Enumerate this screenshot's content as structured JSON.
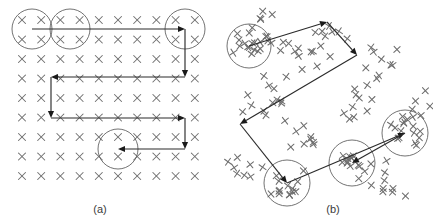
{
  "figure": {
    "width": 433,
    "height": 224,
    "background_color": "#ffffff",
    "mark_color": "#6e6e6e",
    "circle_color": "#5a5a5a",
    "arrow_color": "#1a1a1a",
    "caption_color": "#3a3a3a"
  },
  "panels": [
    {
      "id": "panel-a",
      "caption": "(a)",
      "caption_x": 100,
      "caption_y": 213,
      "description": "Regular rectangular lattice of x-marks traversed by a boustrophedon (serpentine) raster path; three circular regions highlight clusters.",
      "grid": {
        "type": "regular-lattice",
        "columns": 10,
        "rows": 9,
        "x_start": 22,
        "y_start": 20,
        "x_step": 19.2,
        "y_step": 19.5,
        "mark_size": 7
      },
      "circles": [
        {
          "name": "cluster-circle-a1",
          "cx": 32,
          "cy": 29,
          "r": 20
        },
        {
          "name": "cluster-circle-a2",
          "cx": 70,
          "cy": 29,
          "r": 20
        },
        {
          "name": "cluster-circle-a3",
          "cx": 185,
          "cy": 29,
          "r": 20
        },
        {
          "name": "cluster-circle-a4",
          "cx": 118,
          "cy": 149,
          "r": 20
        }
      ],
      "path": {
        "type": "serpentine-raster",
        "segments": [
          {
            "name": "segment-a-1",
            "x1": 32,
            "y1": 29,
            "x2": 185,
            "y2": 29,
            "arrow": "end"
          },
          {
            "name": "segment-a-2",
            "x1": 185,
            "y1": 29,
            "x2": 185,
            "y2": 77,
            "arrow": "end"
          },
          {
            "name": "segment-a-3",
            "x1": 185,
            "y1": 77,
            "x2": 51,
            "y2": 77,
            "arrow": "end"
          },
          {
            "name": "segment-a-4",
            "x1": 51,
            "y1": 77,
            "x2": 51,
            "y2": 118,
            "arrow": "end"
          },
          {
            "name": "segment-a-5",
            "x1": 51,
            "y1": 118,
            "x2": 185,
            "y2": 118,
            "arrow": "end"
          },
          {
            "name": "segment-a-6",
            "x1": 185,
            "y1": 118,
            "x2": 185,
            "y2": 149,
            "arrow": "end"
          },
          {
            "name": "segment-a-7",
            "x1": 185,
            "y1": 149,
            "x2": 118,
            "y2": 149,
            "arrow": "end"
          }
        ]
      }
    },
    {
      "id": "panel-b",
      "caption": "(b)",
      "caption_x": 333,
      "caption_y": 213,
      "description": "Irregular scatter of x-marks traversed by a zig-zag tour between four circled clusters.",
      "scatter": {
        "type": "irregular-scatter",
        "mark_size": 6,
        "count": 148
      },
      "circles": [
        {
          "name": "cluster-circle-b1",
          "cx": 249,
          "cy": 46,
          "r": 22
        },
        {
          "name": "cluster-circle-b2",
          "cx": 405,
          "cy": 133,
          "r": 23
        },
        {
          "name": "cluster-circle-b3",
          "cx": 352,
          "cy": 163,
          "r": 23
        },
        {
          "name": "cluster-circle-b4",
          "cx": 287,
          "cy": 183,
          "r": 23
        }
      ],
      "path": {
        "type": "zig-zag-tour",
        "segments": [
          {
            "name": "segment-b-1",
            "x1": 249,
            "y1": 46,
            "x2": 327,
            "y2": 22,
            "arrow": "end"
          },
          {
            "name": "segment-b-2",
            "x1": 327,
            "y1": 22,
            "x2": 357,
            "y2": 55,
            "arrow": "end"
          },
          {
            "name": "segment-b-3",
            "x1": 357,
            "y1": 55,
            "x2": 240,
            "y2": 124,
            "arrow": "end"
          },
          {
            "name": "segment-b-4",
            "x1": 240,
            "y1": 124,
            "x2": 287,
            "y2": 183,
            "arrow": "end"
          },
          {
            "name": "segment-b-5",
            "x1": 287,
            "y1": 183,
            "x2": 405,
            "y2": 133,
            "arrow": "end"
          },
          {
            "name": "segment-b-6",
            "x1": 405,
            "y1": 133,
            "x2": 352,
            "y2": 163,
            "arrow": "end"
          }
        ]
      }
    }
  ]
}
